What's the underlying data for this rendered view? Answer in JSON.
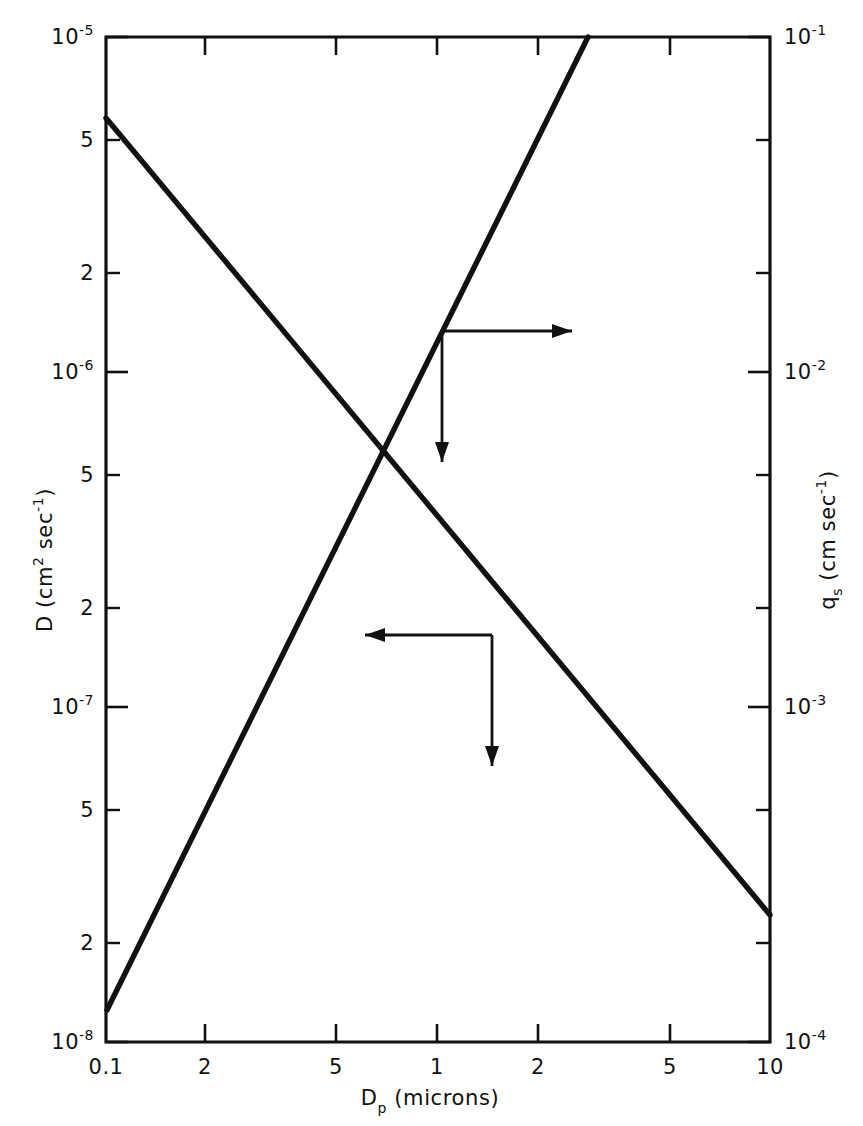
{
  "chart_data": {
    "type": "line",
    "title": "",
    "subtitle": "",
    "xlabel": "D_p (microns)",
    "xlabel_parts": {
      "base": "D",
      "sub": "p",
      "rest": "(microns)"
    },
    "ylabel_left": "D (cm2 sec-1)",
    "ylabel_left_parts": {
      "lead": "D  (cm",
      "sup1": "2",
      "mid": " sec",
      "sup2": "-1",
      "tail": ")"
    },
    "ylabel_right": "q_s (cm sec-1)",
    "ylabel_right_parts": {
      "lead": "q",
      "sub": "s",
      "mid": " (cm sec",
      "sup": "-1",
      "tail": ")"
    },
    "xscale": "log",
    "yscale": "log",
    "xlim": [
      0.1,
      10
    ],
    "ylim_left": [
      1e-08,
      1e-05
    ],
    "ylim_right": [
      0.0001,
      0.1
    ],
    "grid": false,
    "legend": "none",
    "x_ticks": [
      {
        "value": 0.1,
        "label": "0.1",
        "px": 106
      },
      {
        "value": 0.2,
        "label": "2",
        "px": 205
      },
      {
        "value": 0.5,
        "label": "5",
        "px": 336
      },
      {
        "value": 1,
        "label": "1",
        "px": 437
      },
      {
        "value": 2,
        "label": "2",
        "px": 538
      },
      {
        "value": 5,
        "label": "5",
        "px": 670
      },
      {
        "value": 10,
        "label": "10",
        "px": 770
      }
    ],
    "y_ticks_left": [
      {
        "value": 1e-05,
        "mantissa": "10",
        "exponent": "-5",
        "major": true,
        "px": 37
      },
      {
        "value": 5e-06,
        "mantissa": "5",
        "exponent": "",
        "major": false,
        "px": 140
      },
      {
        "value": 2e-06,
        "mantissa": "2",
        "exponent": "",
        "major": false,
        "px": 273
      },
      {
        "value": 1e-06,
        "mantissa": "10",
        "exponent": "-6",
        "major": true,
        "px": 372
      },
      {
        "value": 5e-07,
        "mantissa": "5",
        "exponent": "",
        "major": false,
        "px": 475
      },
      {
        "value": 2e-07,
        "mantissa": "2",
        "exponent": "",
        "major": false,
        "px": 608
      },
      {
        "value": 1e-07,
        "mantissa": "10",
        "exponent": "-7",
        "major": true,
        "px": 707
      },
      {
        "value": 5e-08,
        "mantissa": "5",
        "exponent": "",
        "major": false,
        "px": 810
      },
      {
        "value": 2e-08,
        "mantissa": "2",
        "exponent": "",
        "major": false,
        "px": 943
      },
      {
        "value": 1e-08,
        "mantissa": "10",
        "exponent": "-8",
        "major": true,
        "px": 1042
      }
    ],
    "y_ticks_right": [
      {
        "value": 0.1,
        "mantissa": "10",
        "exponent": "-1",
        "major": true,
        "px": 37
      },
      {
        "value": 0.05,
        "mantissa": "",
        "exponent": "",
        "major": false,
        "px": 140
      },
      {
        "value": 0.02,
        "mantissa": "",
        "exponent": "",
        "major": false,
        "px": 273
      },
      {
        "value": 0.01,
        "mantissa": "10",
        "exponent": "-2",
        "major": true,
        "px": 372
      },
      {
        "value": 0.005,
        "mantissa": "",
        "exponent": "",
        "major": false,
        "px": 475
      },
      {
        "value": 0.002,
        "mantissa": "",
        "exponent": "",
        "major": false,
        "px": 608
      },
      {
        "value": 0.001,
        "mantissa": "10",
        "exponent": "-3",
        "major": true,
        "px": 707
      },
      {
        "value": 0.0005,
        "mantissa": "",
        "exponent": "",
        "major": false,
        "px": 810
      },
      {
        "value": 0.0002,
        "mantissa": "",
        "exponent": "",
        "major": false,
        "px": 943
      },
      {
        "value": 0.0001,
        "mantissa": "10",
        "exponent": "-4",
        "major": true,
        "px": 1042
      }
    ],
    "series": [
      {
        "name": "D",
        "axis": "left",
        "description": "diffusion coefficient, decreasing with particle diameter",
        "x": [
          0.1,
          10
        ],
        "y": [
          5.6e-06,
          2.4e-08
        ],
        "pixel_path": "M 106 118 L 770 915"
      },
      {
        "name": "q_s",
        "axis": "right",
        "description": "settling velocity, increasing with particle diameter",
        "x": [
          0.1,
          2.7
        ],
        "y": [
          0.00012,
          0.1
        ],
        "pixel_path": "M 107 1010 L 588 37"
      }
    ],
    "annotations": [
      {
        "name": "right-axis-pointer",
        "target_series": "q_s",
        "corner_px": [
          442,
          331
        ],
        "arrow_right_to_px": [
          572,
          331
        ],
        "arrow_down_to_px": [
          442,
          462
        ],
        "direction": "right-and-down"
      },
      {
        "name": "left-axis-pointer",
        "target_series": "D",
        "corner_px": [
          492,
          635
        ],
        "arrow_left_to_px": [
          365,
          635
        ],
        "arrow_down_to_px": [
          492,
          766
        ],
        "direction": "left-and-down"
      }
    ]
  },
  "plot_frame": {
    "left_px": 106,
    "right_px": 770,
    "top_px": 37,
    "bottom_px": 1042
  },
  "colors": {
    "ink": "#111111",
    "background": "#ffffff"
  }
}
